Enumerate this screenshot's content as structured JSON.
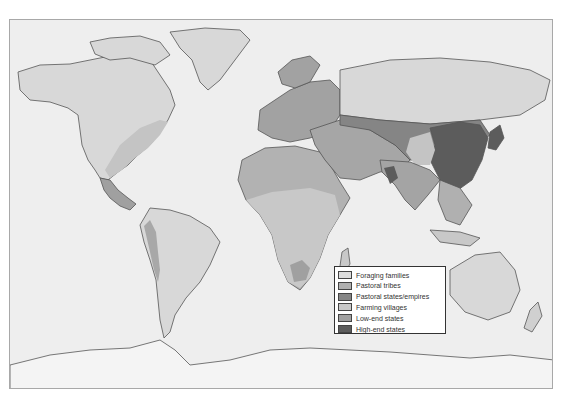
{
  "map": {
    "title": "World map of societal types",
    "colors": {
      "ocean": "#eeeeee",
      "foraging": "#d8d8d8",
      "pastoral_tribes": "#b4b4b4",
      "pastoral_states": "#8a8a8a",
      "farming_villages": "#c6c6c6",
      "low_end_states": "#a2a2a2",
      "high_end_states": "#5f5f5f",
      "coastline": "#555555"
    }
  },
  "legend": {
    "items": [
      {
        "label": "Foraging families",
        "color": "#dcdcdc"
      },
      {
        "label": "Pastoral tribes",
        "color": "#b0b0b0"
      },
      {
        "label": "Pastoral states/empires",
        "color": "#858585"
      },
      {
        "label": "Farming villages",
        "color": "#c8c8c8"
      },
      {
        "label": "Low-end states",
        "color": "#a0a0a0"
      },
      {
        "label": "High-end states",
        "color": "#5c5c5c"
      }
    ]
  }
}
